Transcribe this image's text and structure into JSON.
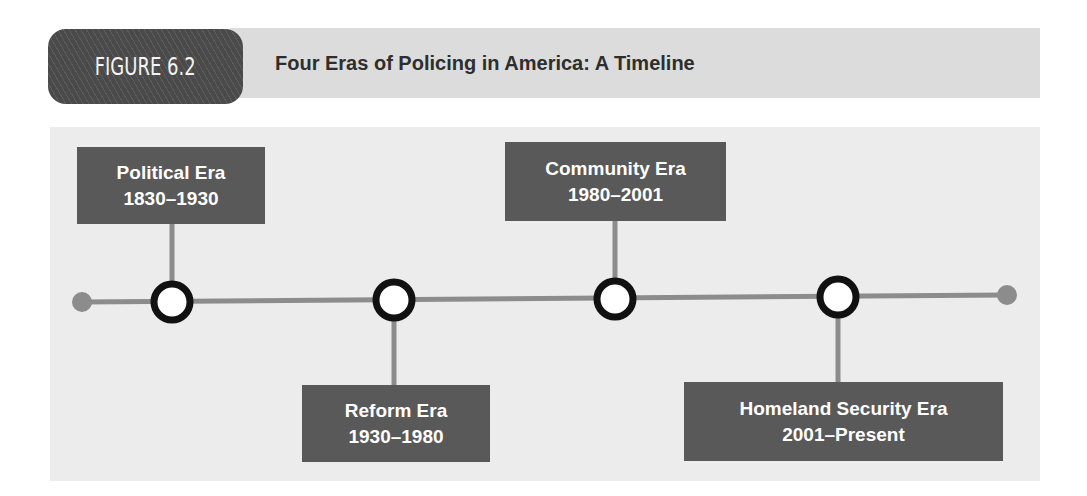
{
  "figure": {
    "label": "FIGURE 6.2",
    "title": "Four Eras of Policing in America: A Timeline"
  },
  "colors": {
    "box_fill": "#595959",
    "line": "#8c8c8c",
    "node_stroke": "#111111",
    "node_fill": "#ffffff",
    "endpoint": "#8c8c8c",
    "panel": "#ececec",
    "header_band": "#dcdcdc"
  },
  "timeline": {
    "eras": [
      {
        "name": "Political Era",
        "period": "1830–1930",
        "start": 1830,
        "end": 1930,
        "label_position": "above"
      },
      {
        "name": "Reform Era",
        "period": "1930–1980",
        "start": 1930,
        "end": 1980,
        "label_position": "below"
      },
      {
        "name": "Community Era",
        "period": "1980–2001",
        "start": 1980,
        "end": 2001,
        "label_position": "above"
      },
      {
        "name": "Homeland Security Era",
        "period": "2001–Present",
        "start": 2001,
        "end": "Present",
        "label_position": "below"
      }
    ]
  }
}
